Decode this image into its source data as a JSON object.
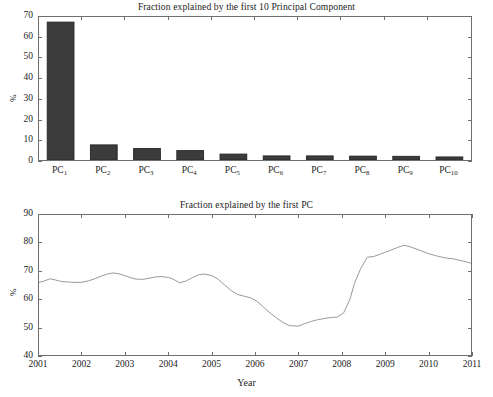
{
  "figure": {
    "background": "#ffffff",
    "axis_color": "#6e6e6e",
    "bar_color": "#3b3b3b",
    "line_color": "#9a9a9a"
  },
  "panels": {
    "bar": {
      "title": "Fraction explained by the first 10 Principal Component",
      "ylabel": "%",
      "xlabel": "",
      "ytick_labels": [
        "0",
        "10",
        "20",
        "30",
        "40",
        "50",
        "60",
        "70"
      ]
    },
    "line": {
      "title": "Fraction explained by the first PC",
      "ylabel": "%",
      "xlabel": "Year",
      "ytick_labels": [
        "40",
        "50",
        "60",
        "70",
        "80",
        "90"
      ],
      "xtick_labels": [
        "2001",
        "2002",
        "2003",
        "2004",
        "2005",
        "2006",
        "2007",
        "2008",
        "2009",
        "2010",
        "2011"
      ]
    }
  },
  "chart_data": [
    {
      "type": "bar",
      "title": "Fraction explained by the first 10 Principal Component",
      "xlabel": "",
      "ylabel": "%",
      "ylim": [
        0,
        70
      ],
      "yticks": [
        0,
        10,
        20,
        30,
        40,
        50,
        60,
        70
      ],
      "grid": false,
      "categories": [
        "PC_1",
        "PC_2",
        "PC_3",
        "PC_4",
        "PC_5",
        "PC_6",
        "PC_7",
        "PC_8",
        "PC_9",
        "PC_10"
      ],
      "category_labels_html": [
        "PC<sub>1</sub>",
        "PC<sub>2</sub>",
        "PC<sub>3</sub>",
        "PC<sub>4</sub>",
        "PC<sub>5</sub>",
        "PC<sub>6</sub>",
        "PC<sub>7</sub>",
        "PC<sub>8</sub>",
        "PC<sub>9</sub>",
        "PC<sub>10</sub>"
      ],
      "values": [
        67.5,
        7.4,
        5.6,
        4.6,
        2.9,
        2.0,
        2.0,
        1.9,
        1.8,
        1.5
      ]
    },
    {
      "type": "line",
      "title": "Fraction explained by the first PC",
      "xlabel": "Year",
      "ylabel": "%",
      "xlim": [
        2001,
        2011
      ],
      "ylim": [
        40,
        90
      ],
      "yticks": [
        40,
        50,
        60,
        70,
        80,
        90
      ],
      "xticks": [
        2001,
        2002,
        2003,
        2004,
        2005,
        2006,
        2007,
        2008,
        2009,
        2010,
        2011
      ],
      "grid": false,
      "legend": "none",
      "x": [
        2001.0,
        2001.12,
        2001.25,
        2001.38,
        2001.5,
        2001.63,
        2001.75,
        2001.88,
        2002.0,
        2002.15,
        2002.3,
        2002.45,
        2002.6,
        2002.72,
        2002.85,
        2003.0,
        2003.12,
        2003.25,
        2003.4,
        2003.55,
        2003.7,
        2003.85,
        2004.0,
        2004.12,
        2004.25,
        2004.4,
        2004.55,
        2004.7,
        2004.82,
        2005.0,
        2005.15,
        2005.3,
        2005.45,
        2005.6,
        2005.75,
        2005.9,
        2006.05,
        2006.2,
        2006.35,
        2006.5,
        2006.65,
        2006.8,
        2007.0,
        2007.15,
        2007.3,
        2007.45,
        2007.6,
        2007.75,
        2007.9,
        2008.05,
        2008.2,
        2008.3,
        2008.45,
        2008.6,
        2008.75,
        2008.9,
        2009.0,
        2009.15,
        2009.3,
        2009.45,
        2009.6,
        2009.8,
        2010.0,
        2010.2,
        2010.4,
        2010.6,
        2010.8,
        2011.0
      ],
      "y": [
        65.9,
        66.4,
        67.2,
        66.8,
        66.3,
        66.1,
        66.0,
        65.9,
        66.0,
        66.5,
        67.3,
        68.2,
        69.0,
        69.3,
        69.0,
        68.3,
        67.6,
        67.1,
        67.0,
        67.4,
        67.9,
        68.0,
        67.7,
        67.0,
        65.8,
        66.4,
        67.6,
        68.7,
        68.9,
        68.4,
        67.0,
        65.0,
        63.0,
        61.6,
        61.0,
        60.4,
        59.2,
        57.0,
        55.0,
        53.2,
        51.6,
        50.5,
        50.3,
        51.2,
        52.0,
        52.6,
        53.0,
        53.4,
        53.5,
        55.0,
        60.0,
        65.5,
        71.0,
        74.9,
        75.2,
        76.0,
        76.6,
        77.5,
        78.4,
        79.2,
        78.6,
        77.5,
        76.3,
        75.4,
        74.7,
        74.3,
        73.6,
        72.8
      ]
    }
  ]
}
